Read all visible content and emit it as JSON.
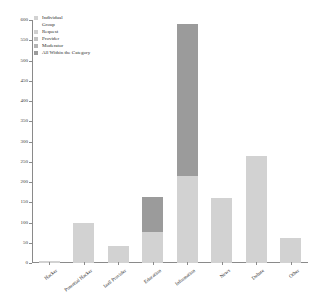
{
  "chart_data": {
    "type": "bar",
    "subtype": "stacked-bar",
    "title": "",
    "xlabel": "",
    "ylabel": "",
    "ylim": [
      0,
      600
    ],
    "yticks": [
      0,
      50,
      100,
      150,
      200,
      250,
      300,
      350,
      400,
      450,
      500,
      550,
      600
    ],
    "grid": false,
    "legend_position": "upper-left",
    "categories": [
      "Hacker",
      "Potential Hacker",
      "IaaS Provider",
      "Education",
      "Information",
      "News",
      "Debate",
      "Other"
    ],
    "series": [
      {
        "name": "Individual",
        "color": "#d2d2d2",
        "values": [
          5,
          99,
          43,
          76,
          216,
          160,
          265,
          62
        ]
      },
      {
        "name": "Group",
        "color": "#dedede",
        "values": [
          0,
          0,
          0,
          0,
          0,
          0,
          0,
          0
        ]
      },
      {
        "name": "Request",
        "color": "#c6c6c6",
        "values": [
          0,
          0,
          0,
          0,
          0,
          0,
          0,
          0
        ]
      },
      {
        "name": "Provider",
        "color": "#bdbdbd",
        "values": [
          0,
          0,
          0,
          0,
          0,
          0,
          0,
          0
        ]
      },
      {
        "name": "Moderator",
        "color": "#ababab",
        "values": [
          0,
          0,
          0,
          0,
          0,
          0,
          0,
          0
        ]
      },
      {
        "name": "All Within the Category",
        "color": "#9b9b9b",
        "values": [
          0,
          0,
          0,
          88,
          374,
          0,
          0,
          0
        ]
      }
    ],
    "totals": [
      5,
      99,
      43,
      164,
      590,
      160,
      265,
      62
    ]
  },
  "legend": {
    "items": [
      {
        "label": "Individual",
        "swatch": "#d2d2d2",
        "has_swatch": true
      },
      {
        "label": "Group",
        "swatch": "#ffffff",
        "has_swatch": false
      },
      {
        "label": "Request",
        "swatch": "#cfcfcf",
        "has_swatch": true
      },
      {
        "label": "Provider",
        "swatch": "#c2c2c2",
        "has_swatch": true
      },
      {
        "label": "Moderator",
        "swatch": "#b4b4b4",
        "has_swatch": true
      },
      {
        "label": "All Within the Category",
        "swatch": "#9b9b9b",
        "has_swatch": true
      }
    ]
  },
  "axes": {
    "y_tick_labels": [
      "0",
      "50",
      "100",
      "150",
      "200",
      "250",
      "300",
      "350",
      "400",
      "450",
      "500",
      "550",
      "600"
    ],
    "x_tick_labels": [
      "Hacker",
      "Potential Hacker",
      "IaaS Provider",
      "Education",
      "Information",
      "News",
      "Debate",
      "Other"
    ]
  },
  "style": {
    "background": "#ffffff",
    "axis_color": "#8a8a8a",
    "bar_light": "#d2d2d2",
    "bar_dark": "#9b9b9b"
  }
}
